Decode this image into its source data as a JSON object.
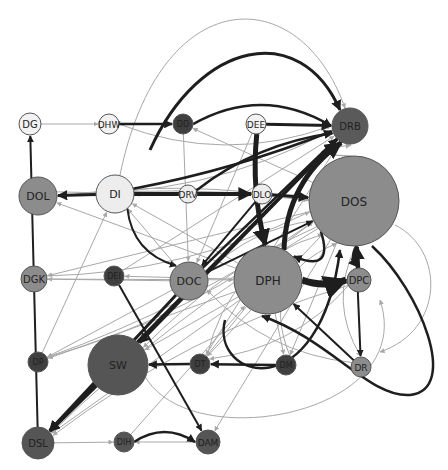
{
  "diagram": {
    "type": "directed-network",
    "width": 448,
    "height": 470,
    "colors": {
      "background": "#ffffff",
      "edge_light": "#a8a8a8",
      "edge_dark": "#1e1e1e",
      "node_stroke": "#555555",
      "label": "#222222"
    },
    "nodes": [
      {
        "id": "DG",
        "label": "DG",
        "x": 30,
        "y": 124,
        "r": 11,
        "fill": "#f2f2f2",
        "font": 10
      },
      {
        "id": "DHW",
        "label": "DHW",
        "x": 109,
        "y": 124,
        "r": 10,
        "fill": "#f2f2f2",
        "font": 9
      },
      {
        "id": "DD",
        "label": "DD",
        "x": 183,
        "y": 124,
        "r": 10,
        "fill": "#3f3f3f",
        "font": 8
      },
      {
        "id": "DEE",
        "label": "DEE",
        "x": 256,
        "y": 124,
        "r": 10,
        "fill": "#f2f2f2",
        "font": 9
      },
      {
        "id": "DRB",
        "label": "DRB",
        "x": 350,
        "y": 126,
        "r": 18,
        "fill": "#5a5a5a",
        "font": 10
      },
      {
        "id": "DOL",
        "label": "DOL",
        "x": 38,
        "y": 196,
        "r": 19,
        "fill": "#8c8c8c",
        "font": 11
      },
      {
        "id": "DI",
        "label": "DI",
        "x": 115,
        "y": 194,
        "r": 19,
        "fill": "#ededed",
        "font": 11
      },
      {
        "id": "DRV",
        "label": "DRV",
        "x": 188,
        "y": 194,
        "r": 9,
        "fill": "#ededed",
        "font": 9
      },
      {
        "id": "DLO",
        "label": "DLO",
        "x": 262,
        "y": 194,
        "r": 10,
        "fill": "#ededed",
        "font": 9
      },
      {
        "id": "DOS",
        "label": "DOS",
        "x": 354,
        "y": 201,
        "r": 45,
        "fill": "#8c8c8c",
        "font": 12
      },
      {
        "id": "DGK",
        "label": "DGK",
        "x": 34,
        "y": 279,
        "r": 13,
        "fill": "#8c8c8c",
        "font": 10
      },
      {
        "id": "DEI",
        "label": "DEI",
        "x": 114,
        "y": 276,
        "r": 10,
        "fill": "#3f3f3f",
        "font": 8
      },
      {
        "id": "DOC",
        "label": "DOC",
        "x": 189,
        "y": 281,
        "r": 19,
        "fill": "#8c8c8c",
        "font": 11
      },
      {
        "id": "DPH",
        "label": "DPH",
        "x": 268,
        "y": 280,
        "r": 34,
        "fill": "#8c8c8c",
        "font": 12
      },
      {
        "id": "DPC",
        "label": "DPC",
        "x": 359,
        "y": 280,
        "r": 12,
        "fill": "#8c8c8c",
        "font": 10
      },
      {
        "id": "DP",
        "label": "DP",
        "x": 38,
        "y": 362,
        "r": 10,
        "fill": "#3f3f3f",
        "font": 8
      },
      {
        "id": "SW",
        "label": "SW",
        "x": 118,
        "y": 365,
        "r": 30,
        "fill": "#555555",
        "font": 11
      },
      {
        "id": "DT",
        "label": "DT",
        "x": 200,
        "y": 364,
        "r": 10,
        "fill": "#3f3f3f",
        "font": 8
      },
      {
        "id": "DM",
        "label": "DM",
        "x": 286,
        "y": 365,
        "r": 10,
        "fill": "#3f3f3f",
        "font": 8
      },
      {
        "id": "DR",
        "label": "DR",
        "x": 361,
        "y": 367,
        "r": 10,
        "fill": "#8c8c8c",
        "font": 9
      },
      {
        "id": "DSL",
        "label": "DSL",
        "x": 38,
        "y": 443,
        "r": 16,
        "fill": "#555555",
        "font": 10
      },
      {
        "id": "DIH",
        "label": "DIH",
        "x": 124,
        "y": 442,
        "r": 10,
        "fill": "#555555",
        "font": 8
      },
      {
        "id": "DAM",
        "label": "DAM",
        "x": 208,
        "y": 442,
        "r": 12,
        "fill": "#555555",
        "font": 9
      }
    ],
    "edges": [
      {
        "from": "DG",
        "to": "DHW",
        "w": 1,
        "dark": false,
        "curve": 0
      },
      {
        "from": "DHW",
        "to": "DD",
        "w": 2.5,
        "dark": true,
        "curve": 0
      },
      {
        "from": "DEE",
        "to": "DRB",
        "w": 3,
        "dark": true,
        "curve": 0
      },
      {
        "from": "DSL",
        "to": "DG",
        "w": 2,
        "dark": true,
        "curve": 0
      },
      {
        "from": "DI",
        "to": "DOL",
        "w": 3,
        "dark": true,
        "curve": 0
      },
      {
        "from": "DI",
        "to": "DLO",
        "w": 4,
        "dark": true,
        "curve": 0
      },
      {
        "from": "DLO",
        "to": "DOS",
        "w": 3,
        "dark": true,
        "curve": 0
      },
      {
        "from": "DI",
        "to": "DOC",
        "w": 2,
        "dark": true,
        "curve": 25
      },
      {
        "from": "DOS",
        "to": "DRB",
        "w": 1.2,
        "dark": false,
        "curve": -60
      },
      {
        "from": "DPH",
        "to": "DPC",
        "w": 7,
        "dark": true,
        "curve": 8
      },
      {
        "from": "DPC",
        "to": "DOS",
        "w": 4,
        "dark": true,
        "curve": 0
      },
      {
        "from": "DOS",
        "to": "DPC",
        "w": 3,
        "dark": true,
        "curve": 8
      },
      {
        "from": "DOS",
        "to": "DR",
        "w": 2,
        "dark": true,
        "curve": 0
      },
      {
        "from": "DT",
        "to": "SW",
        "w": 2.5,
        "dark": true,
        "curve": 0
      },
      {
        "from": "DM",
        "to": "DT",
        "w": 2.5,
        "dark": true,
        "curve": 0
      },
      {
        "from": "DIH",
        "to": "DAM",
        "w": 2.5,
        "dark": true,
        "curve": -20
      },
      {
        "from": "DAM",
        "to": "DIH",
        "w": 1,
        "dark": false,
        "curve": 0
      },
      {
        "from": "DSL",
        "to": "DIH",
        "w": 1,
        "dark": false,
        "curve": 0
      },
      {
        "from": "SW",
        "to": "DSL",
        "w": 3,
        "dark": true,
        "curve": 0
      },
      {
        "from": "DOC",
        "to": "DSL",
        "w": 3,
        "dark": true,
        "curve": 0
      },
      {
        "from": "DRB",
        "to": "DSL",
        "w": 3,
        "dark": true,
        "curve": 0
      },
      {
        "from": "DRB",
        "to": "SW",
        "w": 3,
        "dark": true,
        "curve": 0
      },
      {
        "from": "DEI",
        "to": "DAM",
        "w": 2,
        "dark": true,
        "curve": 0
      },
      {
        "from": "DI",
        "to": "DRB",
        "w": 2.5,
        "dark": true,
        "curve": 10
      },
      {
        "from": "DOC",
        "to": "DRB",
        "w": 2.5,
        "dark": true,
        "curve": 0
      },
      {
        "from": "DPH",
        "to": "DRB",
        "w": 5,
        "dark": true,
        "curve": -30
      },
      {
        "from": "DEE",
        "to": "DPH",
        "w": 5,
        "dark": true,
        "curve": 10
      },
      {
        "from": "DD",
        "to": "DRB",
        "w": 2.5,
        "dark": true,
        "curve": -40
      },
      {
        "from": "DRV",
        "to": "DRB",
        "w": 2.5,
        "dark": true,
        "curve": -20
      },
      {
        "from": "DR",
        "to": "DPH",
        "w": 2,
        "dark": true,
        "curve": 0
      },
      {
        "from": "DOS",
        "to": "DPH",
        "w": 2.5,
        "dark": true,
        "curve": -40
      },
      {
        "from": "DLO",
        "to": "DOC",
        "w": 2,
        "dark": true,
        "curve": 0
      },
      {
        "from": "DOC",
        "to": "DOS",
        "w": 2,
        "dark": true,
        "curve": 0
      },
      {
        "from": "DOL",
        "to": "DRB",
        "w": 1,
        "dark": false,
        "curve": 40
      },
      {
        "from": "DGK",
        "to": "DOS",
        "w": 1,
        "dark": false,
        "curve": 30
      },
      {
        "from": "DP",
        "to": "DOS",
        "w": 1,
        "dark": false,
        "curve": 30
      },
      {
        "from": "DOS",
        "to": "DGK",
        "w": 1,
        "dark": false,
        "curve": 0
      },
      {
        "from": "DOS",
        "to": "DOL",
        "w": 1,
        "dark": false,
        "curve": 20
      },
      {
        "from": "DPH",
        "to": "DI",
        "w": 1,
        "dark": false,
        "curve": 0
      },
      {
        "from": "DOS",
        "to": "DP",
        "w": 1,
        "dark": false,
        "curve": -20
      },
      {
        "from": "DPH",
        "to": "DP",
        "w": 1,
        "dark": false,
        "curve": 0
      },
      {
        "from": "DOC",
        "to": "DGK",
        "w": 1,
        "dark": false,
        "curve": 0
      },
      {
        "from": "DPH",
        "to": "DM",
        "w": 1,
        "dark": false,
        "curve": 0
      },
      {
        "from": "DOS",
        "to": "DM",
        "w": 1,
        "dark": false,
        "curve": 0
      },
      {
        "from": "DOS",
        "to": "DT",
        "w": 1,
        "dark": false,
        "curve": 0
      },
      {
        "from": "DOS",
        "to": "SW",
        "w": 1,
        "dark": false,
        "curve": 20
      },
      {
        "from": "DPH",
        "to": "DSL",
        "w": 1,
        "dark": false,
        "curve": 0
      },
      {
        "from": "DOS",
        "to": "DSL",
        "w": 1,
        "dark": false,
        "curve": 20
      },
      {
        "from": "DHW",
        "to": "DRB",
        "w": 1,
        "dark": false,
        "curve": 40
      },
      {
        "from": "DOS",
        "to": "DD",
        "w": 1,
        "dark": false,
        "curve": 0
      },
      {
        "from": "DOS",
        "to": "DI",
        "w": 1,
        "dark": false,
        "curve": 10
      },
      {
        "from": "DPH",
        "to": "DOL",
        "w": 1,
        "dark": false,
        "curve": 0
      },
      {
        "from": "DPC",
        "to": "DT",
        "w": 1,
        "dark": false,
        "curve": -30
      },
      {
        "from": "DR",
        "to": "DOC",
        "w": 1,
        "dark": false,
        "curve": -30
      },
      {
        "from": "DM",
        "to": "DOS",
        "w": 1,
        "dark": false,
        "curve": -60
      },
      {
        "from": "DT",
        "to": "DOS",
        "w": 1,
        "dark": false,
        "curve": -50
      },
      {
        "from": "DIH",
        "to": "DPH",
        "w": 1,
        "dark": false,
        "curve": 0
      },
      {
        "from": "DOC",
        "to": "DI",
        "w": 1,
        "dark": false,
        "curve": 0
      },
      {
        "from": "DEI",
        "to": "DRB",
        "w": 1,
        "dark": false,
        "curve": 0
      },
      {
        "from": "DPC",
        "to": "DSL",
        "w": 1,
        "dark": false,
        "curve": 30
      },
      {
        "from": "DGK",
        "to": "DPH",
        "w": 1,
        "dark": false,
        "curve": 0
      },
      {
        "from": "DP",
        "to": "DI",
        "w": 1,
        "dark": false,
        "curve": 0
      },
      {
        "from": "DOL",
        "to": "DOS",
        "w": 1,
        "dark": false,
        "curve": -15
      },
      {
        "from": "DEE",
        "to": "DOC",
        "w": 1,
        "dark": false,
        "curve": 0
      },
      {
        "from": "DD",
        "to": "DOC",
        "w": 1,
        "dark": false,
        "curve": 0
      },
      {
        "from": "DPH",
        "to": "DEI",
        "w": 1,
        "dark": false,
        "curve": 0
      },
      {
        "from": "DRB",
        "to": "DT",
        "w": 1,
        "dark": false,
        "curve": 0
      },
      {
        "from": "DOS",
        "to": "DR",
        "w": 1,
        "dark": false,
        "curve": 30
      },
      {
        "from": "DPH",
        "to": "DT",
        "w": 1,
        "dark": false,
        "curve": 0
      },
      {
        "from": "DOS",
        "to": "DAM",
        "w": 1,
        "dark": false,
        "curve": 0
      },
      {
        "from": "DOC",
        "to": "DP",
        "w": 1,
        "dark": false,
        "curve": 0
      },
      {
        "from": "DPH",
        "to": "SW",
        "w": 1,
        "dark": false,
        "curve": 0
      },
      {
        "from": "DOS",
        "to": "DOC",
        "w": 1,
        "dark": false,
        "curve": 20
      }
    ],
    "loops": [
      {
        "d": "M 372 246 C 420 290, 460 390, 410 395 C 370 398, 330 340, 262 316",
        "w": 2.5,
        "dark": true
      },
      {
        "d": "M 120 175 C 160 -20, 300 -20, 345 108",
        "w": 1,
        "dark": false
      },
      {
        "d": "M 150 150 C 200 40, 300 20, 340 110",
        "w": 3,
        "dark": true
      },
      {
        "d": "M 395 225 C 445 250, 445 330, 380 352",
        "w": 1,
        "dark": false
      },
      {
        "d": "M 225 320 C 210 380, 320 410, 340 250",
        "w": 2.5,
        "dark": true
      },
      {
        "d": "M 140 365 C 170 460, 420 420, 380 300",
        "w": 1,
        "dark": false
      }
    ]
  }
}
